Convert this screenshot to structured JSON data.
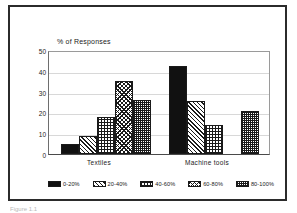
{
  "chart_data": {
    "type": "bar",
    "title": "",
    "ylabel": "% of Responses",
    "xlabel": "",
    "ylim": [
      0,
      50
    ],
    "yticks": [
      0,
      10,
      20,
      30,
      40,
      50
    ],
    "grid": true,
    "legend_position": "bottom",
    "categories": [
      "Textiles",
      "Machine tools"
    ],
    "series": [
      {
        "name": "0-20%",
        "values": [
          5,
          43
        ]
      },
      {
        "name": "20-40%",
        "values": [
          9,
          26
        ]
      },
      {
        "name": "40-60%",
        "values": [
          18,
          14
        ]
      },
      {
        "name": "60-80%",
        "values": [
          36,
          0
        ]
      },
      {
        "name": "80-100%",
        "values": [
          26.5,
          21
        ]
      }
    ]
  },
  "axis": {
    "y_title": "% of Responses",
    "ticks": {
      "t0": "0",
      "t1": "10",
      "t2": "20",
      "t3": "30",
      "t4": "40",
      "t5": "50"
    }
  },
  "groups": {
    "g0": "Textiles",
    "g1": "Machine tools"
  },
  "legend": {
    "i0": "0-20%",
    "i1": "20-40%",
    "i2": "40-60%",
    "i3": "60-80%",
    "i4": "80-100%"
  },
  "caption": "Figure 1.1"
}
